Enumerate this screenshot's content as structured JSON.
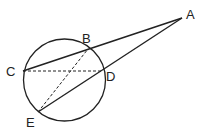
{
  "diagram": {
    "type": "geometry",
    "circle": {
      "cx": 64.5,
      "cy": 80,
      "r": 41
    },
    "points": [
      {
        "name": "A",
        "x": 182,
        "y": 18,
        "label_x": 186,
        "label_y": 19
      },
      {
        "name": "B",
        "x": 88,
        "y": 49,
        "label_x": 82,
        "label_y": 43
      },
      {
        "name": "C",
        "x": 23,
        "y": 71,
        "label_x": 6,
        "label_y": 76
      },
      {
        "name": "D",
        "x": 102,
        "y": 71,
        "label_x": 106,
        "label_y": 81
      },
      {
        "name": "E",
        "x": 38,
        "y": 112,
        "label_x": 26,
        "label_y": 127
      }
    ],
    "segments": [
      {
        "from": "C",
        "to": "A",
        "style": "solid"
      },
      {
        "from": "E",
        "to": "A",
        "style": "solid"
      },
      {
        "from": "C",
        "to": "D",
        "style": "dashed"
      },
      {
        "from": "E",
        "to": "B",
        "style": "dashed"
      }
    ],
    "labels": {
      "A": "A",
      "B": "B",
      "C": "C",
      "D": "D",
      "E": "E"
    }
  }
}
